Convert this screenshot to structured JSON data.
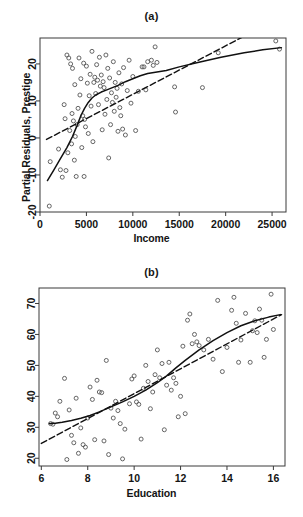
{
  "figure": {
    "panels": [
      {
        "id": "a",
        "title": "(a)",
        "xlabel": "Income",
        "ylabel": "Partial Residuals, Prestige"
      },
      {
        "id": "b",
        "title": "(b)",
        "xlabel": "Education",
        "ylabel": "Partial Residuals, Prestige"
      }
    ],
    "colors": {
      "axis": "#3a3a3a",
      "point": "#555555",
      "solid_line": "#111111",
      "dashed_line": "#111111",
      "background": "#ffffff"
    }
  },
  "chart_data": [
    {
      "type": "scatter",
      "panel": "a",
      "title": "(a)",
      "xlabel": "Income",
      "ylabel": "Partial Residuals, Prestige",
      "xlim": [
        0,
        26500
      ],
      "ylim": [
        -20,
        27
      ],
      "xticks": [
        0,
        5000,
        10000,
        15000,
        20000,
        25000
      ],
      "xticklabels": [
        "0",
        "5000",
        "10000",
        "15000",
        "20000",
        "25000"
      ],
      "yticks": [
        -20,
        -10,
        0,
        10,
        20
      ],
      "yticklabels": [
        "-20",
        "-10",
        "0",
        "10",
        "20"
      ],
      "grid": false,
      "legend": null,
      "marker": "open-circle",
      "points": [
        [
          1000,
          -18.4
        ],
        [
          1100,
          -6.4
        ],
        [
          2000,
          -3.0
        ],
        [
          2200,
          -8.6
        ],
        [
          2400,
          -10.6
        ],
        [
          2600,
          9.0
        ],
        [
          2700,
          5.2
        ],
        [
          2800,
          -8.8
        ],
        [
          2900,
          22.4
        ],
        [
          3000,
          -4.0
        ],
        [
          3100,
          21.6
        ],
        [
          3200,
          2.0
        ],
        [
          3300,
          20.0
        ],
        [
          3400,
          -1.6
        ],
        [
          3450,
          6.6
        ],
        [
          3500,
          18.8
        ],
        [
          3600,
          4.6
        ],
        [
          3700,
          -6.0
        ],
        [
          3750,
          14.4
        ],
        [
          3800,
          0.4
        ],
        [
          3900,
          -10.4
        ],
        [
          4000,
          3.6
        ],
        [
          4100,
          8.0
        ],
        [
          4200,
          21.6
        ],
        [
          4300,
          11.6
        ],
        [
          4400,
          16.0
        ],
        [
          4500,
          -2.6
        ],
        [
          4600,
          6.0
        ],
        [
          4700,
          20.2
        ],
        [
          4750,
          -10.4
        ],
        [
          4800,
          5.0
        ],
        [
          4900,
          3.0
        ],
        [
          5000,
          19.4
        ],
        [
          5100,
          14.8
        ],
        [
          5200,
          1.2
        ],
        [
          5300,
          11.4
        ],
        [
          5400,
          17.2
        ],
        [
          5500,
          8.6
        ],
        [
          5600,
          23.4
        ],
        [
          5700,
          -1.0
        ],
        [
          5800,
          15.0
        ],
        [
          5900,
          16.4
        ],
        [
          6000,
          12.0
        ],
        [
          6100,
          19.8
        ],
        [
          6200,
          15.6
        ],
        [
          6300,
          9.0
        ],
        [
          6400,
          21.8
        ],
        [
          6500,
          14.0
        ],
        [
          6600,
          17.0
        ],
        [
          6700,
          2.2
        ],
        [
          6800,
          15.2
        ],
        [
          6900,
          13.6
        ],
        [
          7000,
          6.4
        ],
        [
          7100,
          22.4
        ],
        [
          7200,
          10.4
        ],
        [
          7300,
          18.8
        ],
        [
          7400,
          -5.4
        ],
        [
          7500,
          16.2
        ],
        [
          7600,
          3.6
        ],
        [
          7700,
          12.2
        ],
        [
          7800,
          9.6
        ],
        [
          7900,
          20.6
        ],
        [
          8000,
          7.2
        ],
        [
          8100,
          15.0
        ],
        [
          8200,
          11.0
        ],
        [
          8300,
          13.4
        ],
        [
          8400,
          1.8
        ],
        [
          8500,
          17.6
        ],
        [
          8600,
          8.2
        ],
        [
          8700,
          6.0
        ],
        [
          8800,
          14.6
        ],
        [
          8900,
          2.4
        ],
        [
          9000,
          19.0
        ],
        [
          9200,
          0.8
        ],
        [
          9400,
          12.8
        ],
        [
          9600,
          21.0
        ],
        [
          9800,
          9.4
        ],
        [
          10000,
          16.6
        ],
        [
          10300,
          2.0
        ],
        [
          10600,
          12.6
        ],
        [
          11000,
          19.2
        ],
        [
          11200,
          19.2
        ],
        [
          11400,
          13.0
        ],
        [
          11600,
          20.6
        ],
        [
          12000,
          21.0
        ],
        [
          12200,
          19.6
        ],
        [
          12400,
          24.6
        ],
        [
          12600,
          20.4
        ],
        [
          14500,
          13.8
        ],
        [
          14600,
          7.0
        ],
        [
          17500,
          13.6
        ],
        [
          19200,
          23.0
        ],
        [
          25400,
          26.2
        ],
        [
          25800,
          24.0
        ]
      ],
      "lines": [
        {
          "name": "lowess-smooth",
          "style": "solid",
          "points": [
            [
              800,
              -11.5
            ],
            [
              1500,
              -8.6
            ],
            [
              2200,
              -5.6
            ],
            [
              2900,
              -2.6
            ],
            [
              3500,
              0.4
            ],
            [
              4000,
              3.4
            ],
            [
              4400,
              6.0
            ],
            [
              4800,
              8.0
            ],
            [
              5200,
              9.6
            ],
            [
              5600,
              10.8
            ],
            [
              6000,
              11.6
            ],
            [
              6600,
              12.4
            ],
            [
              7200,
              13.0
            ],
            [
              7800,
              13.6
            ],
            [
              8400,
              14.2
            ],
            [
              9200,
              15.2
            ],
            [
              10000,
              16.0
            ],
            [
              10800,
              16.8
            ],
            [
              11600,
              17.4
            ],
            [
              12600,
              17.8
            ],
            [
              13600,
              18.2
            ],
            [
              15000,
              19.2
            ],
            [
              17000,
              20.4
            ],
            [
              19500,
              21.8
            ],
            [
              22000,
              23.0
            ],
            [
              24000,
              23.8
            ],
            [
              26000,
              24.4
            ]
          ]
        },
        {
          "name": "linear-fit",
          "style": "dashed",
          "points": [
            [
              700,
              -0.4
            ],
            [
              22000,
              27.5
            ]
          ]
        }
      ]
    },
    {
      "type": "scatter",
      "panel": "b",
      "title": "(b)",
      "xlabel": "Education",
      "ylabel": "Partial Residuals, Prestige",
      "xlim": [
        5.9,
        16.5
      ],
      "ylim": [
        17.5,
        75
      ],
      "xticks": [
        6,
        8,
        10,
        12,
        14,
        16
      ],
      "xticklabels": [
        "6",
        "8",
        "10",
        "12",
        "14",
        "16"
      ],
      "yticks": [
        20,
        30,
        40,
        50,
        60,
        70
      ],
      "yticklabels": [
        "20",
        "30",
        "40",
        "50",
        "60",
        "70"
      ],
      "grid": false,
      "legend": null,
      "marker": "open-circle",
      "points": [
        [
          6.4,
          31.2
        ],
        [
          6.5,
          31.0
        ],
        [
          6.6,
          34.6
        ],
        [
          6.7,
          33.4
        ],
        [
          6.8,
          38.4
        ],
        [
          7.0,
          45.8
        ],
        [
          7.1,
          19.6
        ],
        [
          7.2,
          35.6
        ],
        [
          7.3,
          27.4
        ],
        [
          7.4,
          25.0
        ],
        [
          7.5,
          39.4
        ],
        [
          7.6,
          21.6
        ],
        [
          7.7,
          29.8
        ],
        [
          7.8,
          24.4
        ],
        [
          7.9,
          23.6
        ],
        [
          8.0,
          33.0
        ],
        [
          8.1,
          43.0
        ],
        [
          8.2,
          39.0
        ],
        [
          8.3,
          26.0
        ],
        [
          8.4,
          45.2
        ],
        [
          8.5,
          41.4
        ],
        [
          8.6,
          41.2
        ],
        [
          8.7,
          25.6
        ],
        [
          8.8,
          51.6
        ],
        [
          8.9,
          21.2
        ],
        [
          9.0,
          36.2
        ],
        [
          9.1,
          33.0
        ],
        [
          9.2,
          38.4
        ],
        [
          9.3,
          35.4
        ],
        [
          9.4,
          31.2
        ],
        [
          9.5,
          19.8
        ],
        [
          9.6,
          29.4
        ],
        [
          9.8,
          37.6
        ],
        [
          9.9,
          45.6
        ],
        [
          10.0,
          46.6
        ],
        [
          10.1,
          38.2
        ],
        [
          10.2,
          37.4
        ],
        [
          10.3,
          26.2
        ],
        [
          10.4,
          42.6
        ],
        [
          10.5,
          50.0
        ],
        [
          10.6,
          44.8
        ],
        [
          10.7,
          36.0
        ],
        [
          10.8,
          41.4
        ],
        [
          10.9,
          47.0
        ],
        [
          11.0,
          55.0
        ],
        [
          11.1,
          46.0
        ],
        [
          11.2,
          50.6
        ],
        [
          11.3,
          29.2
        ],
        [
          11.4,
          43.6
        ],
        [
          11.5,
          51.0
        ],
        [
          11.6,
          42.0
        ],
        [
          11.7,
          46.0
        ],
        [
          11.8,
          44.2
        ],
        [
          11.9,
          33.4
        ],
        [
          12.0,
          40.0
        ],
        [
          12.1,
          56.2
        ],
        [
          12.2,
          34.4
        ],
        [
          12.3,
          64.6
        ],
        [
          12.4,
          66.6
        ],
        [
          12.5,
          57.0
        ],
        [
          12.6,
          60.0
        ],
        [
          12.7,
          57.6
        ],
        [
          12.8,
          56.4
        ],
        [
          13.0,
          55.0
        ],
        [
          13.2,
          58.4
        ],
        [
          13.4,
          52.0
        ],
        [
          13.6,
          71.0
        ],
        [
          13.8,
          48.0
        ],
        [
          14.0,
          55.8
        ],
        [
          14.2,
          67.8
        ],
        [
          14.3,
          72.0
        ],
        [
          14.4,
          63.6
        ],
        [
          14.5,
          51.0
        ],
        [
          14.6,
          58.2
        ],
        [
          14.8,
          66.8
        ],
        [
          15.0,
          51.0
        ],
        [
          15.1,
          61.2
        ],
        [
          15.2,
          64.4
        ],
        [
          15.3,
          60.6
        ],
        [
          15.4,
          68.2
        ],
        [
          15.5,
          64.6
        ],
        [
          15.6,
          52.6
        ],
        [
          15.7,
          58.4
        ],
        [
          15.9,
          73.0
        ],
        [
          16.0,
          61.6
        ]
      ],
      "lines": [
        {
          "name": "lowess-smooth",
          "style": "solid",
          "points": [
            [
              6.35,
              31.2
            ],
            [
              6.6,
              31.3
            ],
            [
              6.9,
              31.6
            ],
            [
              7.3,
              32.2
            ],
            [
              7.7,
              32.9
            ],
            [
              8.1,
              33.8
            ],
            [
              8.5,
              35.0
            ],
            [
              9.0,
              36.6
            ],
            [
              9.5,
              38.2
            ],
            [
              10.0,
              40.0
            ],
            [
              10.5,
              42.0
            ],
            [
              11.0,
              44.4
            ],
            [
              11.4,
              46.6
            ],
            [
              11.8,
              49.2
            ],
            [
              12.2,
              51.6
            ],
            [
              12.8,
              55.0
            ],
            [
              13.4,
              58.0
            ],
            [
              14.0,
              60.6
            ],
            [
              14.6,
              62.8
            ],
            [
              15.2,
              64.4
            ],
            [
              15.8,
              65.6
            ],
            [
              16.3,
              66.4
            ]
          ]
        },
        {
          "name": "linear-fit",
          "style": "dashed",
          "points": [
            [
              6.0,
              24.8
            ],
            [
              16.35,
              66.4
            ]
          ]
        }
      ]
    }
  ]
}
